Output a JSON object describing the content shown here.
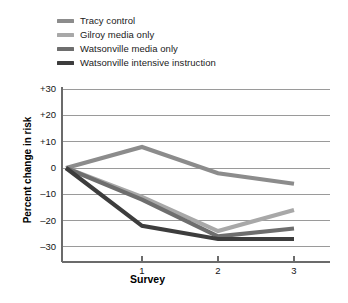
{
  "chart_data": {
    "type": "line",
    "title": "",
    "subtitle": "",
    "xlabel": "Survey",
    "ylabel": "Percent change in risk",
    "x": [
      0,
      1,
      2,
      3
    ],
    "x_tick_positions": [
      1,
      2,
      3
    ],
    "x_tick_labels": [
      "1",
      "2",
      "3"
    ],
    "xlim": [
      0,
      3.3
    ],
    "ylim": [
      -35,
      33
    ],
    "y_ticks": [
      30,
      20,
      10,
      0,
      -10,
      -20,
      -30
    ],
    "y_tick_labels": [
      "+30",
      "+20",
      "+10",
      "0",
      "–10",
      "–20",
      "–30"
    ],
    "grid": "horizontal",
    "legend_position": "top-left",
    "series": [
      {
        "name": "Tracy control",
        "color": "#8c8c8c",
        "values": [
          0,
          8,
          -2,
          -6
        ]
      },
      {
        "name": "Gilroy media only",
        "color": "#a8a8a8",
        "values": [
          0,
          -11,
          -24,
          -16
        ]
      },
      {
        "name": "Watsonville media only",
        "color": "#6e6e6e",
        "values": [
          0,
          -12,
          -26,
          -23
        ]
      },
      {
        "name": "Watsonville intensive instruction",
        "color": "#3d3d3d",
        "values": [
          0,
          -22,
          -27,
          -27
        ]
      }
    ],
    "annotations": []
  },
  "legend": {
    "items": [
      {
        "label": "Tracy control",
        "color": "#8c8c8c"
      },
      {
        "label": "Gilroy media only",
        "color": "#a8a8a8"
      },
      {
        "label": "Watsonville media only",
        "color": "#6e6e6e"
      },
      {
        "label": "Watsonville intensive instruction",
        "color": "#3d3d3d"
      }
    ]
  },
  "axes": {
    "y_title": "Percent change in risk",
    "x_title": "Survey",
    "y_tick_labels": [
      "+30",
      "+20",
      "+10",
      "0",
      "–10",
      "–20",
      "–30"
    ],
    "x_tick_labels": [
      "1",
      "2",
      "3"
    ]
  },
  "colors": {
    "gridline": "#9a9a9a",
    "axis": "#6b6b6b",
    "text": "#111111",
    "background": "#ffffff"
  }
}
